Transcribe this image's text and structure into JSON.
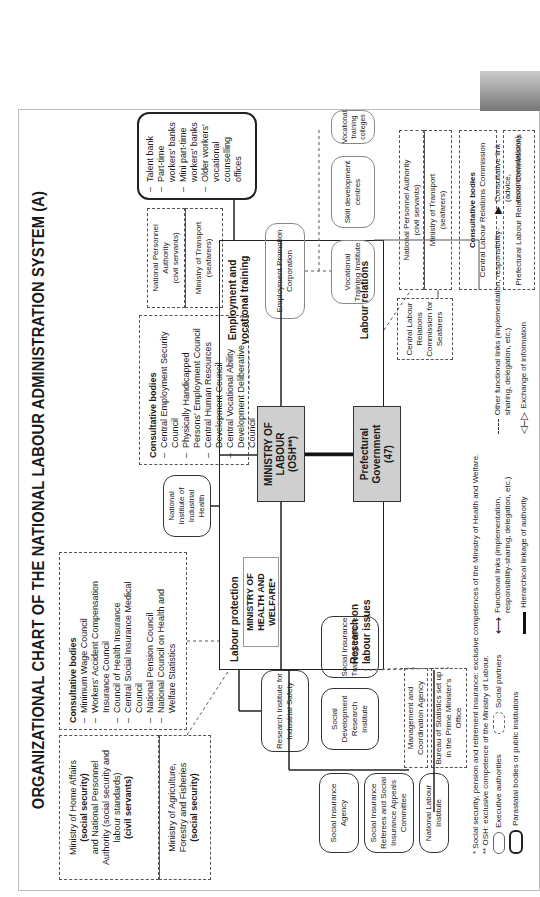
{
  "title": "ORGANIZATIONAL CHART OF THE NATIONAL LABOUR ADMINISTRATION SYSTEM (A)",
  "left_column": {
    "home_affairs": {
      "line1": "Ministry of Home Affairs",
      "bold1": "(social security)",
      "line2": "and National Personnel",
      "line3": "Authority (social security and",
      "line4": "labour standards)",
      "bold2": "(civil servants)"
    },
    "agriculture": {
      "line1": "Ministry of Agriculture,",
      "line2": "Forestry and Fisheries",
      "bold": "(social security)"
    }
  },
  "consultative_protection": {
    "heading": "Consultative bodies",
    "items": [
      "Minimum Wage Council",
      "Workers' Accident Compensation Insurance Council",
      "Council of Health Insurance",
      "Central Social Insurance Medical Council",
      "National Pension Council",
      "National Council on Health and Welfare Statistics"
    ]
  },
  "consultative_employment": {
    "heading": "Consultative bodies",
    "items": [
      "Central Employment Security Council",
      "Physically Handicapped Persons' Employment Council",
      "Central Human Resources Development Council",
      "Central Vocational Ability Development Deliberative Council"
    ]
  },
  "industrial_health": "National Institute of Industrial Health",
  "personnel_transport_top": {
    "npa": "National Personnel Authority",
    "npa_sub": "(civil servants)",
    "mot": "Ministry of Transport",
    "mot_sub": "(seafarers)"
  },
  "talent_box": {
    "items": [
      "Talent bank",
      "Part-time workers' banks",
      "Mini part-time workers' banks",
      "Older workers' vocational counselling offices"
    ]
  },
  "central": {
    "q_labour_protection": "Labour protection",
    "q_employment": "Employment and vocational training",
    "q_research": "Research on labour issues",
    "q_labour_relations": "Labour relations",
    "ministry_labour": "MINISTRY OF LABOUR (OSH**)",
    "ministry_health": "MINISTRY OF HEALTH AND WELFARE*",
    "prefectural": "Prefectural Government (47)"
  },
  "employment_bodies": {
    "epc": "Employment Promotion Corporation",
    "vti": "Vocational Training Institute",
    "sdc": "Skill development centres",
    "vtc": "Vocational training colleges"
  },
  "personnel_transport_right": {
    "npa": "National Personnel Authority",
    "npa_sub": "(civil servants)",
    "mot": "Ministry of Transport",
    "mot_sub": "(seafarers)"
  },
  "clrc_seafarers": "Central Labour Relations Commission for Seafarers",
  "consultative_relations": {
    "heading": "Consultative bodies",
    "text": "Central Labour Relations Commission"
  },
  "prefectural_commissions": "Prefectural Labour Relations Commissions",
  "lower_bodies": {
    "risafety": "Research Institute for Industrial Safety",
    "sia": "Social Insurance Agency",
    "sirefs": "Social Insurance Referees and Social Insurance Appeals Committee",
    "sdri": "Social Development Research Institute",
    "siti": "Social Insurance Training Institute",
    "nli": "National Labour Institute",
    "mca": "Management and Coordination Agency",
    "bureau": "Bureau of Statistics set up in the Prime Minister's Office"
  },
  "footnotes": [
    "* Social security, pension and retirement insurance: exclusive competences of the Ministry of Health and Welfare.",
    "** OSH: exclusive competence of the Ministry of Labour."
  ],
  "legend": {
    "executive": "Executive authorities",
    "social_partners": "Social partners",
    "parastatal": "Parastatal bodies or public institutions",
    "functional": "Functional links (implementation, responsibility-sharing, delegation, etc.)",
    "hierarchical": "Hierarchical linkage of authority",
    "other_functional": "Other functional links (implementation, responsibility-sharing, delegation, etc.)",
    "exchange": "Exchange of information",
    "consultative": "Consultative link (advice, recommendations)"
  }
}
